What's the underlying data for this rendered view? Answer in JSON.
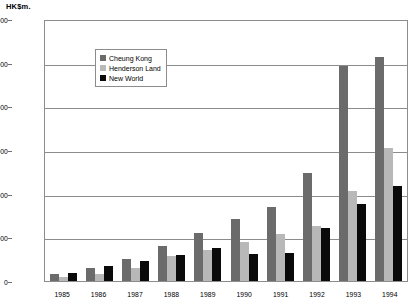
{
  "unit_label": "HK$m.",
  "legend": {
    "position": "inside-top-left",
    "items": [
      {
        "label": "Cheung Kong",
        "color": "#6b6b6b",
        "key": "cheung_kong"
      },
      {
        "label": "Henderson Land",
        "color": "#b8b8b8",
        "key": "henderson_land"
      },
      {
        "label": "New World",
        "color": "#0a0a0a",
        "key": "new_world"
      }
    ]
  },
  "y_axis": {
    "ticks": [
      "12,000",
      "10,000",
      "8,000",
      "6,000",
      "4,000",
      "2,000",
      "0"
    ],
    "values": [
      12000,
      10000,
      8000,
      6000,
      4000,
      2000,
      0
    ],
    "min": 0,
    "max": 12000,
    "step": 2000
  },
  "chart_data": {
    "type": "bar",
    "title": "",
    "subtitle": "",
    "xlabel": "",
    "ylabel": "HK$m.",
    "ylim": [
      0,
      12000
    ],
    "grid": true,
    "legend_position": "inside-top-left",
    "categories": [
      "1985",
      "1986",
      "1987",
      "1988",
      "1989",
      "1990",
      "1991",
      "1992",
      "1993",
      "1994"
    ],
    "series": [
      {
        "name": "Cheung Kong",
        "color": "#6b6b6b",
        "values": [
          300,
          600,
          1000,
          1600,
          2200,
          2850,
          3400,
          4950,
          9850,
          10250
        ]
      },
      {
        "name": "Henderson Land",
        "color": "#b8b8b8",
        "values": [
          200,
          330,
          600,
          1150,
          1400,
          1800,
          2150,
          2500,
          4100,
          6100
        ]
      },
      {
        "name": "New World",
        "color": "#0a0a0a",
        "values": [
          350,
          700,
          900,
          1200,
          1500,
          1250,
          1300,
          2450,
          3550,
          4350
        ]
      }
    ]
  }
}
